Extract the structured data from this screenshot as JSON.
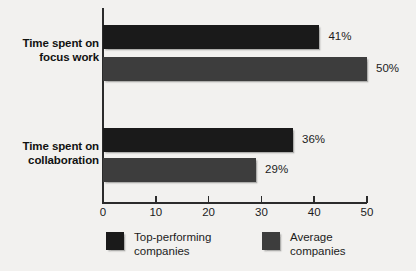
{
  "chart_data": {
    "type": "bar",
    "orientation": "horizontal",
    "title": "",
    "subtitle": "",
    "xlabel": "",
    "ylabel": "",
    "xlim": [
      0,
      50
    ],
    "xticks": [
      "0",
      "10",
      "20",
      "30",
      "40",
      "50"
    ],
    "grid": false,
    "legend_position": "bottom",
    "categories": [
      {
        "line1": "Time spent on",
        "line2": "focus work"
      },
      {
        "line1": "Time spent on",
        "line2": "collaboration"
      }
    ],
    "series": [
      {
        "name": {
          "line1": "Top-performing",
          "line2": "companies"
        },
        "color": "#1a1a1a",
        "values": [
          41,
          36
        ],
        "value_labels": [
          "41%",
          "36%"
        ]
      },
      {
        "name": {
          "line1": "Average",
          "line2": "companies"
        },
        "color": "#3d3d3d",
        "values": [
          50,
          29
        ],
        "value_labels": [
          "50%",
          "29%"
        ]
      }
    ],
    "background_color": "#f2f1ef",
    "axis_color": "#2b2b2b"
  }
}
